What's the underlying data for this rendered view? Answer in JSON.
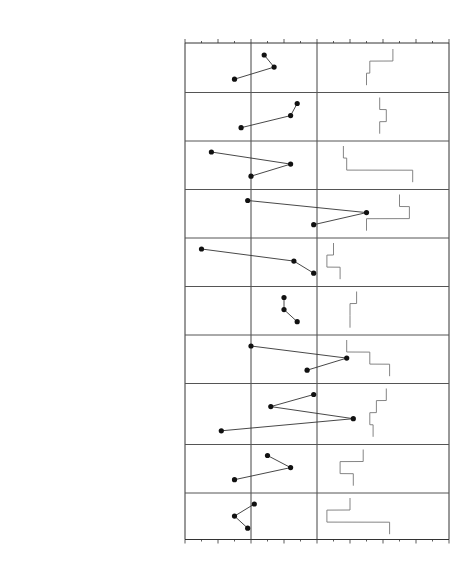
{
  "header": {
    "score_label": "Score",
    "raw_label": "Raw",
    "t_label": "T"
  },
  "axis": {
    "ticks": [
      "≤30",
      "40",
      "50",
      "60",
      "70",
      "80",
      "90",
      "100",
      "≥110"
    ],
    "values": [
      30,
      40,
      50,
      60,
      70,
      80,
      90,
      100,
      110
    ]
  },
  "chart_data": {
    "type": "line",
    "title": "",
    "xlabel": "T score",
    "ylabel": "",
    "xlim": [
      30,
      110
    ],
    "reference_lines": [
      50,
      70
    ],
    "grid": false,
    "scales": [
      {
        "group": "SOM",
        "rows": [
          {
            "code": "SOM-C",
            "name": "Conversion",
            "raw": 4,
            "t": 54
          },
          {
            "code": "SOM-S",
            "name": "Somatization",
            "raw": 7,
            "t": 57
          },
          {
            "code": "SOM-H",
            "name": "Health Concerns",
            "raw": 2,
            "t": 45
          }
        ]
      },
      {
        "group": "ANX",
        "rows": [
          {
            "code": "ANX-C",
            "name": "Cognitive",
            "raw": 12,
            "t": 64
          },
          {
            "code": "ANX-A",
            "name": "Affective",
            "raw": 11,
            "t": 62
          },
          {
            "code": "ANX-P",
            "name": "Physiological",
            "raw": 3,
            "t": 47
          }
        ]
      },
      {
        "group": "ARD",
        "rows": [
          {
            "code": "ARD-O",
            "name": "Obsessive-Compulsive",
            "raw": 5,
            "t": 38
          },
          {
            "code": "ARD-P",
            "name": "Phobias",
            "raw": 11,
            "t": 62
          },
          {
            "code": "ARD-T",
            "name": "Traumatic Stress",
            "raw": 4,
            "t": 50
          }
        ]
      },
      {
        "group": "DEP",
        "rows": [
          {
            "code": "DEP-C",
            "name": "Cognitive",
            "raw": 4,
            "t": 49
          },
          {
            "code": "DEP-A",
            "name": "Affective",
            "raw": 17,
            "t": 85
          },
          {
            "code": "DEP-P",
            "name": "Physiological",
            "raw": 14,
            "t": 69
          }
        ]
      },
      {
        "group": "MAN",
        "rows": [
          {
            "code": "MAN-A",
            "name": "Activity Level",
            "raw": 2,
            "t": 35
          },
          {
            "code": "MAN-G",
            "name": "Grandiosity",
            "raw": 14,
            "t": 63
          },
          {
            "code": "MAN-I",
            "name": "Irritability",
            "raw": 16,
            "t": 69
          }
        ]
      },
      {
        "group": "PAR",
        "rows": [
          {
            "code": "PAR-H",
            "name": "Hypervigilance",
            "raw": 11,
            "t": 60
          },
          {
            "code": "PAR-P",
            "name": "Persecution",
            "raw": 7,
            "t": 60
          },
          {
            "code": "PAR-R",
            "name": "Resentment",
            "raw": 12,
            "t": 64
          }
        ]
      },
      {
        "group": "SCZ",
        "rows": [
          {
            "code": "SCZ-P",
            "name": "Psychotic Experiences",
            "raw": 4,
            "t": 50
          },
          {
            "code": "SCZ-S",
            "name": "Social Detachment",
            "raw": 17,
            "t": 79
          },
          {
            "code": "SCZ-T",
            "name": "Thought Disorder",
            "raw": 10,
            "t": 67
          }
        ]
      },
      {
        "group": "BOR",
        "rows": [
          {
            "code": "BOR-A",
            "name": "Affective Instability",
            "raw": 11,
            "t": 69
          },
          {
            "code": "BOR-I",
            "name": "Identity Problems",
            "raw": 7,
            "t": 56
          },
          {
            "code": "BOR-N",
            "name": "Negative Relationships",
            "raw": 15,
            "t": 81
          },
          {
            "code": "BOR-S",
            "name": "Self-Harm",
            "raw": 1,
            "t": 41
          }
        ]
      },
      {
        "group": "ANT",
        "rows": [
          {
            "code": "ANT-A",
            "name": "Antisocial Behaviors",
            "raw": 7,
            "t": 55
          },
          {
            "code": "ANT-E",
            "name": "Egocentricity",
            "raw": 7,
            "t": 62
          },
          {
            "code": "ANT-S",
            "name": "Stimulus-Seeking",
            "raw": 3,
            "t": 45
          }
        ]
      },
      {
        "group": "AGG",
        "rows": [
          {
            "code": "AGG-A",
            "name": "Aggressive Attitude",
            "raw": 6,
            "t": 51
          },
          {
            "code": "AGG-V",
            "name": "Verbal Aggression",
            "raw": 5,
            "t": 45
          },
          {
            "code": "AGG-P",
            "name": "Physical Aggression",
            "raw": 2,
            "t": 49
          }
        ]
      }
    ],
    "skyline_t": [
      [
        93,
        86,
        85
      ],
      [
        89,
        91,
        89
      ],
      [
        78,
        79,
        99
      ],
      [
        95,
        98,
        85
      ],
      [
        75,
        73,
        77
      ],
      [
        82,
        80,
        80
      ],
      [
        79,
        86,
        92
      ],
      [
        91,
        88,
        86,
        87
      ],
      [
        84,
        77,
        81
      ],
      [
        80,
        73,
        92
      ]
    ]
  }
}
